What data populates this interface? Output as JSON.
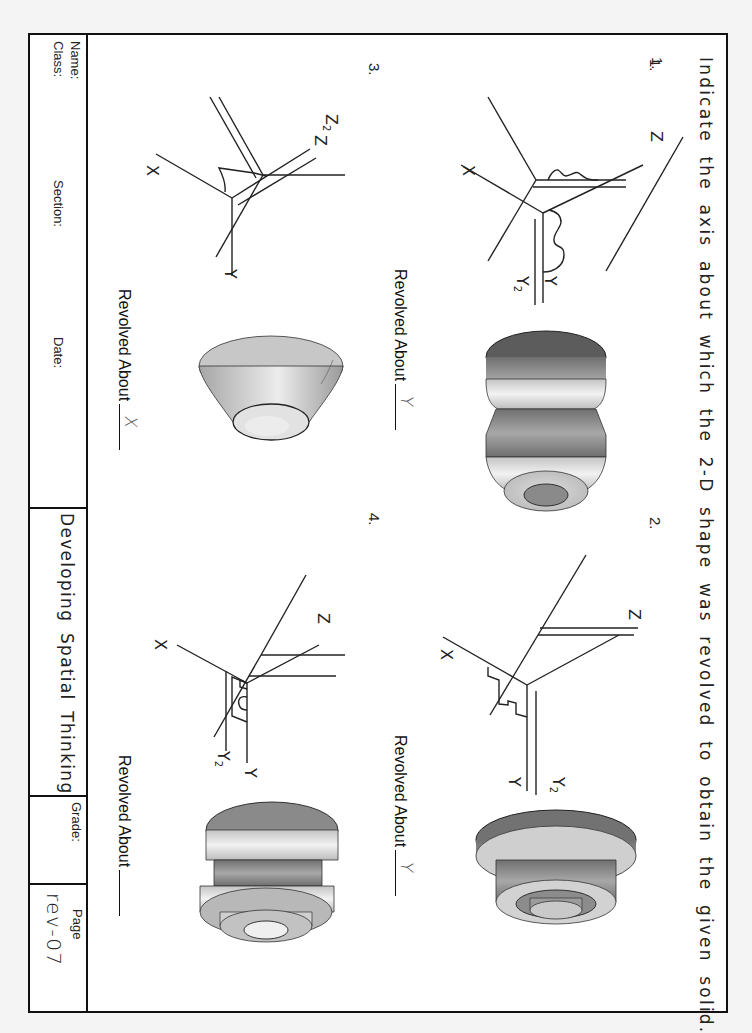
{
  "worksheet": {
    "instruction": "Indicate the axis about which the 2-D shape was revolved to obtain the given solid.",
    "problems": [
      {
        "number": "1.",
        "axes": {
          "z": "Z",
          "y": "Y",
          "y2": "Y",
          "y2_sub": "2",
          "x": "X"
        },
        "revolved_label": "Revolved About",
        "answer": "Y"
      },
      {
        "number": "2.",
        "axes": {
          "z": "Z",
          "y": "Y",
          "y2": "Y",
          "y2_sub": "2",
          "x": "X"
        },
        "revolved_label": "Revolved About",
        "answer": "Y"
      },
      {
        "number": "3.",
        "axes": {
          "z": "Z",
          "z2": "Z",
          "z2_sub": "2",
          "y": "Y",
          "x": "X"
        },
        "revolved_label": "Revolved About",
        "answer": "X"
      },
      {
        "number": "4.",
        "axes": {
          "z": "Z",
          "y": "Y",
          "y2": "Y",
          "y2_sub": "2",
          "x": "X"
        },
        "revolved_label": "Revolved About",
        "answer": ""
      }
    ]
  },
  "title_block": {
    "name_label": "Name:",
    "class_label": "Class:",
    "section_label": "Section:",
    "date_label": "Date:",
    "title": "Developing Spatial Thinking",
    "grade_label": "Grade:",
    "page_label": "Page",
    "page_value": "rev-07"
  },
  "colors": {
    "paper": "#ffffff",
    "background": "#f4f4f4",
    "ink": "#1a1a1a",
    "solid_light": "#e6e6e6",
    "solid_mid": "#b4b4b4",
    "solid_dark": "#7c7c7c",
    "handwriting": "#555555"
  }
}
